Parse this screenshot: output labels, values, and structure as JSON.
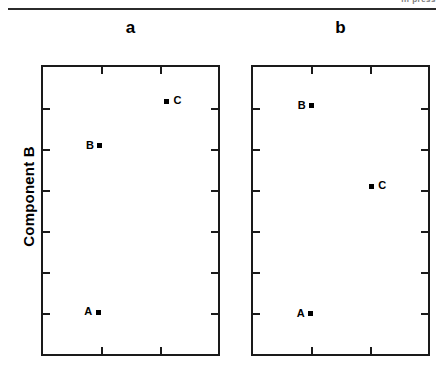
{
  "page": {
    "running_head": "in press",
    "y_axis_title": "Component B"
  },
  "chart_data": {
    "type": "scatter",
    "title": "",
    "ylabel": "Component B",
    "xlabel": "",
    "grid": false,
    "legend": null,
    "panels": [
      {
        "id": "a",
        "label": "a",
        "xlim": [
          0,
          1
        ],
        "ylim": [
          0,
          1
        ],
        "x_ticks_interior": 2,
        "y_ticks_interior": 6,
        "points": [
          {
            "name": "A",
            "label": "A",
            "x": 0.315,
            "y": 0.145,
            "label_side": "left"
          },
          {
            "name": "B",
            "label": "B",
            "x": 0.325,
            "y": 0.725,
            "label_side": "left"
          },
          {
            "name": "C",
            "label": "C",
            "x": 0.705,
            "y": 0.88,
            "label_side": "right"
          }
        ]
      },
      {
        "id": "b",
        "label": "b",
        "xlim": [
          0,
          1
        ],
        "ylim": [
          0,
          1
        ],
        "x_ticks_interior": 2,
        "y_ticks_interior": 6,
        "points": [
          {
            "name": "A",
            "label": "A",
            "x": 0.33,
            "y": 0.14,
            "label_side": "left"
          },
          {
            "name": "B",
            "label": "B",
            "x": 0.335,
            "y": 0.865,
            "label_side": "left"
          },
          {
            "name": "C",
            "label": "C",
            "x": 0.675,
            "y": 0.585,
            "label_side": "right"
          }
        ]
      }
    ]
  },
  "layout": {
    "panels": [
      {
        "left": 41,
        "top": 65,
        "width": 179,
        "height": 291,
        "label_left": 41,
        "label_top": 18,
        "label_width": 179
      },
      {
        "left": 251,
        "top": 65,
        "width": 179,
        "height": 291,
        "label_left": 251,
        "label_top": 18,
        "label_width": 179
      }
    ]
  }
}
